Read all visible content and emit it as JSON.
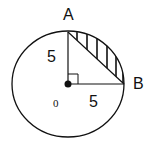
{
  "diagram": {
    "points": {
      "A": {
        "label": "A"
      },
      "B": {
        "label": "B"
      },
      "O": {
        "label": "0"
      }
    },
    "lengths": {
      "OA": "5",
      "OB": "5"
    },
    "colors": {
      "stroke": "#111111",
      "background": "#ffffff"
    }
  }
}
